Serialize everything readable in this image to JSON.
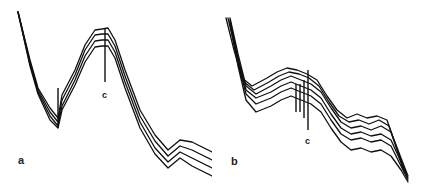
{
  "chart_data": [
    {
      "type": "line",
      "panel": "a",
      "title": "",
      "xlabel": "",
      "ylabel": "",
      "grid": false,
      "legend": "none",
      "annotations": [
        "c"
      ],
      "series": [
        {
          "name": "curve 1",
          "points": [
            [
              18,
              12
            ],
            [
              30,
              60
            ],
            [
              38,
              88
            ],
            [
              50,
              108
            ],
            [
              58,
              118
            ],
            [
              62,
              95
            ],
            [
              75,
              70
            ],
            [
              85,
              45
            ],
            [
              95,
              30
            ],
            [
              102,
              29
            ],
            [
              108,
              28
            ],
            [
              115,
              40
            ],
            [
              125,
              70
            ],
            [
              140,
              110
            ],
            [
              155,
              135
            ],
            [
              168,
              150
            ],
            [
              180,
              140
            ],
            [
              192,
              142
            ],
            [
              212,
              152
            ]
          ]
        },
        {
          "name": "curve 2",
          "points": [
            [
              18,
              12
            ],
            [
              30,
              62
            ],
            [
              38,
              90
            ],
            [
              50,
              112
            ],
            [
              58,
              122
            ],
            [
              62,
              100
            ],
            [
              75,
              75
            ],
            [
              85,
              50
            ],
            [
              95,
              35
            ],
            [
              102,
              34
            ],
            [
              108,
              34
            ],
            [
              115,
              46
            ],
            [
              125,
              76
            ],
            [
              140,
              116
            ],
            [
              155,
              141
            ],
            [
              168,
              156
            ],
            [
              180,
              146
            ],
            [
              192,
              150
            ],
            [
              212,
              160
            ]
          ]
        },
        {
          "name": "curve 3",
          "points": [
            [
              18,
              12
            ],
            [
              30,
              64
            ],
            [
              38,
              92
            ],
            [
              50,
              116
            ],
            [
              58,
              126
            ],
            [
              62,
              106
            ],
            [
              75,
              80
            ],
            [
              85,
              56
            ],
            [
              95,
              41
            ],
            [
              102,
              40
            ],
            [
              108,
              40
            ],
            [
              115,
              52
            ],
            [
              125,
              82
            ],
            [
              140,
              122
            ],
            [
              155,
              148
            ],
            [
              168,
              162
            ],
            [
              180,
              152
            ],
            [
              192,
              158
            ],
            [
              212,
              168
            ]
          ]
        },
        {
          "name": "curve 4",
          "points": [
            [
              18,
              12
            ],
            [
              30,
              66
            ],
            [
              38,
              94
            ],
            [
              50,
              120
            ],
            [
              58,
              128
            ],
            [
              62,
              110
            ],
            [
              75,
              85
            ],
            [
              85,
              62
            ],
            [
              95,
              47
            ],
            [
              102,
              46
            ],
            [
              108,
              46
            ],
            [
              115,
              58
            ],
            [
              125,
              88
            ],
            [
              140,
              128
            ],
            [
              155,
              154
            ],
            [
              168,
              168
            ],
            [
              180,
              158
            ],
            [
              192,
              166
            ],
            [
              212,
              176
            ]
          ]
        }
      ]
    },
    {
      "type": "line",
      "panel": "b",
      "title": "",
      "xlabel": "",
      "ylabel": "",
      "grid": false,
      "legend": "none",
      "annotations": [
        "c"
      ],
      "series": [
        {
          "name": "curve 1",
          "points": [
            [
              14,
              18
            ],
            [
              22,
              50
            ],
            [
              30,
              78
            ],
            [
              40,
              86
            ],
            [
              55,
              78
            ],
            [
              65,
              72
            ],
            [
              75,
              68
            ],
            [
              85,
              70
            ],
            [
              95,
              74
            ],
            [
              105,
              80
            ],
            [
              115,
              96
            ],
            [
              125,
              110
            ],
            [
              135,
              118
            ],
            [
              145,
              114
            ],
            [
              155,
              118
            ],
            [
              165,
              116
            ],
            [
              175,
              120
            ],
            [
              185,
              150
            ],
            [
              192,
              172
            ]
          ]
        },
        {
          "name": "curve 2",
          "points": [
            [
              16,
              18
            ],
            [
              24,
              52
            ],
            [
              32,
              82
            ],
            [
              42,
              90
            ],
            [
              57,
              82
            ],
            [
              67,
              76
            ],
            [
              77,
              72
            ],
            [
              87,
              74
            ],
            [
              97,
              78
            ],
            [
              107,
              86
            ],
            [
              117,
              102
            ],
            [
              127,
              116
            ],
            [
              137,
              122
            ],
            [
              147,
              120
            ],
            [
              157,
              124
            ],
            [
              167,
              120
            ],
            [
              177,
              126
            ],
            [
              187,
              154
            ],
            [
              194,
              174
            ]
          ]
        },
        {
          "name": "curve 3",
          "points": [
            [
              18,
              18
            ],
            [
              26,
              54
            ],
            [
              34,
              86
            ],
            [
              44,
              94
            ],
            [
              59,
              86
            ],
            [
              69,
              80
            ],
            [
              79,
              76
            ],
            [
              89,
              80
            ],
            [
              99,
              84
            ],
            [
              109,
              92
            ],
            [
              119,
              108
            ],
            [
              129,
              122
            ],
            [
              139,
              128
            ],
            [
              149,
              126
            ],
            [
              159,
              130
            ],
            [
              169,
              126
            ],
            [
              179,
              132
            ],
            [
              189,
              158
            ],
            [
              196,
              176
            ]
          ]
        },
        {
          "name": "curve 4",
          "points": [
            [
              18,
              20
            ],
            [
              26,
              58
            ],
            [
              34,
              90
            ],
            [
              44,
              98
            ],
            [
              59,
              92
            ],
            [
              69,
              86
            ],
            [
              79,
              82
            ],
            [
              89,
              86
            ],
            [
              99,
              90
            ],
            [
              109,
              98
            ],
            [
              119,
              114
            ],
            [
              129,
              128
            ],
            [
              139,
              134
            ],
            [
              149,
              132
            ],
            [
              159,
              136
            ],
            [
              169,
              134
            ],
            [
              179,
              140
            ],
            [
              189,
              162
            ],
            [
              196,
              178
            ]
          ]
        },
        {
          "name": "curve 5",
          "points": [
            [
              18,
              22
            ],
            [
              26,
              62
            ],
            [
              34,
              94
            ],
            [
              44,
              104
            ],
            [
              59,
              98
            ],
            [
              69,
              92
            ],
            [
              79,
              88
            ],
            [
              89,
              92
            ],
            [
              99,
              96
            ],
            [
              109,
              104
            ],
            [
              119,
              120
            ],
            [
              129,
              134
            ],
            [
              139,
              140
            ],
            [
              149,
              138
            ],
            [
              159,
              142
            ],
            [
              169,
              140
            ],
            [
              179,
              146
            ],
            [
              189,
              166
            ],
            [
              196,
              180
            ]
          ]
        },
        {
          "name": "curve 6",
          "points": [
            [
              18,
              24
            ],
            [
              26,
              66
            ],
            [
              34,
              100
            ],
            [
              44,
              112
            ],
            [
              59,
              106
            ],
            [
              69,
              100
            ],
            [
              79,
              96
            ],
            [
              89,
              100
            ],
            [
              99,
              104
            ],
            [
              109,
              112
            ],
            [
              119,
              128
            ],
            [
              129,
              142
            ],
            [
              139,
              150
            ],
            [
              149,
              148
            ],
            [
              159,
              152
            ],
            [
              169,
              150
            ],
            [
              179,
              156
            ],
            [
              189,
              170
            ],
            [
              196,
              182
            ]
          ]
        }
      ]
    }
  ],
  "labels": {
    "panel_a": "a",
    "panel_b": "b",
    "marker_a": "c",
    "marker_b": "c"
  }
}
